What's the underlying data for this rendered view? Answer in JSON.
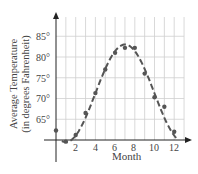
{
  "chart_data": {
    "type": "scatter",
    "title": "",
    "xlabel": "Month",
    "ylabel": "Average Temperature (in degrees Fahrenheit)",
    "ylabel_lines": [
      "Average Temperature",
      "(in degrees Fahrenheit)"
    ],
    "x_ticks": [
      "2",
      "4",
      "6",
      "8",
      "10",
      "12"
    ],
    "y_ticks": [
      "65°",
      "70°",
      "75°",
      "80°",
      "85°"
    ],
    "xlim": [
      0,
      13
    ],
    "ylim": [
      60,
      88
    ],
    "grid": true,
    "legend": "none",
    "series": [
      {
        "name": "Average Temperature",
        "type": "scatter",
        "x": [
          0,
          1,
          2,
          3,
          4,
          5,
          6,
          7,
          8,
          9,
          10,
          11,
          12
        ],
        "values": [
          62.3,
          59.6,
          61.2,
          66.5,
          71.3,
          77.0,
          81.0,
          82.2,
          82.2,
          76.0,
          70.3,
          68.0,
          62.0
        ]
      },
      {
        "name": "Fitted curve",
        "type": "line",
        "style": "dashed",
        "model": "sinusoidal",
        "min": {
          "x": 1,
          "y": 59.5
        },
        "max": {
          "x": 7,
          "y": 83
        }
      }
    ]
  },
  "colors": {
    "axis": "#222222",
    "grid": "#cfcfcf",
    "curve": "#555555",
    "points": "#555555",
    "text": "#444444"
  }
}
